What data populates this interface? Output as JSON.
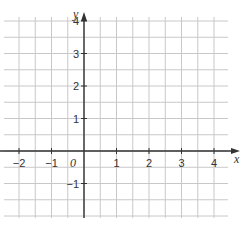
{
  "chart_data": {
    "type": "coordinate-grid",
    "title": "",
    "xlabel": "x",
    "ylabel": "y",
    "origin_label": "0",
    "xlim": [
      -2.5,
      4.5
    ],
    "ylim": [
      -2,
      4.5
    ],
    "x_ticks": [
      -2,
      -1,
      1,
      2,
      3,
      4
    ],
    "y_ticks": [
      -1,
      1,
      2,
      3,
      4
    ],
    "x_tick_labels": [
      "−2",
      "−1",
      "1",
      "2",
      "3",
      "4"
    ],
    "y_tick_labels": [
      "−1",
      "1",
      "2",
      "3",
      "4"
    ],
    "grid": true,
    "grid_step": 0.5,
    "series": []
  },
  "colors": {
    "grid": "#c8c8c8",
    "axis": "#333333",
    "background": "#ffffff"
  }
}
